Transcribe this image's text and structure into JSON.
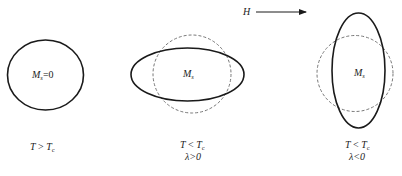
{
  "field_arrow": {
    "label": "H",
    "direction": "right"
  },
  "panels": [
    {
      "id": "paramagnetic",
      "shape_label_main": "M",
      "shape_label_sub": "s",
      "shape_label_suffix": "=0",
      "condition_line1_main": "T",
      "condition_line1_op": " > ",
      "condition_line1_var": "T",
      "condition_line1_sub": "c",
      "condition_line2": ""
    },
    {
      "id": "positive-magnetostriction",
      "shape_label_main": "M",
      "shape_label_sub": "s",
      "shape_label_suffix": "",
      "condition_line1_main": "T",
      "condition_line1_op": " < ",
      "condition_line1_var": "T",
      "condition_line1_sub": "c",
      "condition_line2": "λ>0"
    },
    {
      "id": "negative-magnetostriction",
      "shape_label_main": "M",
      "shape_label_sub": "s",
      "shape_label_suffix": "",
      "condition_line1_main": "T",
      "condition_line1_op": " < ",
      "condition_line1_var": "T",
      "condition_line1_sub": "c",
      "condition_line2": "λ<0"
    }
  ],
  "colors": {
    "solid_stroke": "#1a1a1a",
    "dashed_stroke": "#777777",
    "background": "#ffffff"
  }
}
